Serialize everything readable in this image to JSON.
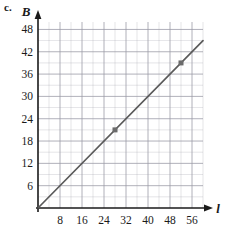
{
  "part_label": "c.",
  "chart_data": {
    "type": "line",
    "title": "",
    "xlabel": "l",
    "ylabel": "B",
    "xlim": [
      0,
      60
    ],
    "ylim": [
      0,
      50
    ],
    "grid": true,
    "legend": "none",
    "x_ticks": [
      8,
      16,
      24,
      32,
      40,
      48,
      56
    ],
    "y_ticks": [
      6,
      12,
      18,
      24,
      30,
      36,
      42,
      48
    ],
    "x_tick_labels": [
      "8",
      "16",
      "24",
      "32",
      "40",
      "48",
      "56"
    ],
    "y_tick_labels": [
      "6",
      "12",
      "18",
      "24",
      "30",
      "36",
      "42",
      "48"
    ],
    "x_minor_step": 4,
    "y_minor_step": 3,
    "series": [
      {
        "name": "B vs l",
        "type": "line",
        "slope": 0.75,
        "intercept": 0,
        "x": [
          0,
          60
        ],
        "values": [
          0,
          45
        ],
        "color": "#5a5a5a",
        "markers": [
          {
            "x": 28,
            "y": 21
          },
          {
            "x": 52,
            "y": 39
          }
        ]
      }
    ],
    "axis_color": "#1a1a1a",
    "grid_color": "#9a9aa6",
    "line_color": "#5a5a5a",
    "marker_color": "#6b6b6b"
  }
}
